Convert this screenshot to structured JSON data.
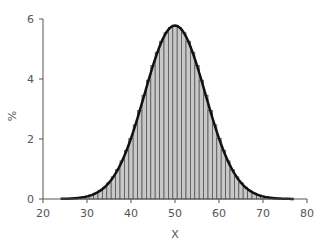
{
  "chart_data": {
    "type": "bar",
    "subtype": "histogram-with-normal-curve",
    "title": "",
    "xlabel": "X",
    "ylabel": "%",
    "xlim": [
      20,
      80
    ],
    "ylim": [
      0,
      6
    ],
    "x_ticks": [
      20,
      30,
      40,
      50,
      60,
      70,
      80
    ],
    "y_ticks": [
      0,
      2,
      4,
      6
    ],
    "grid": false,
    "legend": null,
    "bin_width": 1,
    "bins": [
      24,
      25,
      26,
      27,
      28,
      29,
      30,
      31,
      32,
      33,
      34,
      35,
      36,
      37,
      38,
      39,
      40,
      41,
      42,
      43,
      44,
      45,
      46,
      47,
      48,
      49,
      50,
      51,
      52,
      53,
      54,
      55,
      56,
      57,
      58,
      59,
      60,
      61,
      62,
      63,
      64,
      65,
      66,
      67,
      68,
      69,
      70,
      71,
      72,
      73,
      74,
      75,
      76
    ],
    "values": [
      0.0,
      0.01,
      0.01,
      0.02,
      0.04,
      0.06,
      0.09,
      0.13,
      0.19,
      0.28,
      0.39,
      0.54,
      0.74,
      0.98,
      1.27,
      1.62,
      2.02,
      2.47,
      2.95,
      3.46,
      3.96,
      4.45,
      4.89,
      5.26,
      5.54,
      5.72,
      5.78,
      5.72,
      5.54,
      5.26,
      4.89,
      4.45,
      3.96,
      3.46,
      2.95,
      2.47,
      2.02,
      1.62,
      1.27,
      0.98,
      0.74,
      0.54,
      0.39,
      0.28,
      0.19,
      0.13,
      0.09,
      0.06,
      0.04,
      0.02,
      0.01,
      0.01,
      0.0
    ],
    "overlay_curve": {
      "type": "normal",
      "mean": 50,
      "sd": 6.9,
      "x_range": [
        24,
        77
      ]
    },
    "colors": {
      "bar_fill": "#c8c8c8",
      "bar_stroke": "#555555",
      "curve": "#111111",
      "axis": "#555555"
    }
  }
}
